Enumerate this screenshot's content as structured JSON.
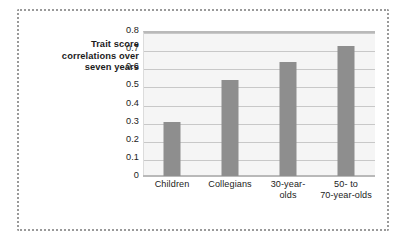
{
  "chart_data": {
    "type": "bar",
    "title": "",
    "xlabel": "",
    "ylabel": "Trait score correlations over seven years",
    "ylabel_lines": [
      "Trait score",
      "correlations over",
      "seven years"
    ],
    "categories": [
      "Children",
      "Collegians",
      "30-year-olds",
      "50- to 70-year-olds"
    ],
    "category_label_lines": [
      [
        "Children"
      ],
      [
        "Collegians"
      ],
      [
        "30-year-",
        "olds"
      ],
      [
        "50- to",
        "70-year-olds"
      ]
    ],
    "values": [
      0.3,
      0.53,
      0.63,
      0.72
    ],
    "ylim": [
      0,
      0.8
    ],
    "ytick_values": [
      0,
      0.1,
      0.2,
      0.3,
      0.4,
      0.5,
      0.6,
      0.7,
      0.8
    ],
    "ytick_labels": [
      "0",
      "0.1",
      "0.2",
      "0.3",
      "0.4",
      "0.5",
      "0.6",
      "0.7",
      "0.8"
    ],
    "grid": true,
    "legend": false,
    "bar_color": "#8e8e8e",
    "plot_background": "#f5f5f5",
    "gridline_color": "#c8c8c8",
    "axis_line_color": "#b9b9b9",
    "frame_color": "#9a9a9a"
  }
}
